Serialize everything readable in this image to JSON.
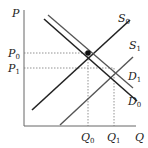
{
  "diagram": {
    "type": "supply-demand",
    "axes": {
      "y_label": "P",
      "x_label": "Q"
    },
    "price_levels": [
      {
        "label": "P",
        "sub": "0",
        "y": 53
      },
      {
        "label": "P",
        "sub": "1",
        "y": 68
      }
    ],
    "quantity_levels": [
      {
        "label": "Q",
        "sub": "0",
        "x": 88
      },
      {
        "label": "Q",
        "sub": "1",
        "x": 114
      }
    ],
    "curves": [
      {
        "name": "S",
        "sub": "0",
        "kind": "supply"
      },
      {
        "name": "S",
        "sub": "1",
        "kind": "supply"
      },
      {
        "name": "D",
        "sub": "1",
        "kind": "demand"
      },
      {
        "name": "D",
        "sub": "0",
        "kind": "demand"
      }
    ],
    "equilibrium_point": {
      "label": "E",
      "x": 88,
      "y": 53
    },
    "colors": {
      "curve": "#222222",
      "guide": "#777777",
      "axis": "#666666"
    }
  }
}
